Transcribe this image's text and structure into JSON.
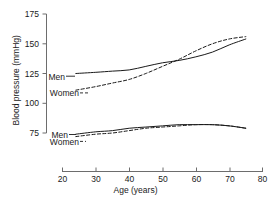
{
  "chart_data": {
    "type": "line",
    "title": "",
    "xlabel": "Age (years)",
    "ylabel": "Blood pressure (mmHg)",
    "xlim": [
      20,
      80
    ],
    "ylim": [
      75,
      175
    ],
    "xticks": [
      20,
      30,
      40,
      50,
      60,
      70,
      80
    ],
    "xtick_labels": [
      "20",
      "30",
      "40",
      "50",
      "60",
      "70",
      "80"
    ],
    "yticks": [
      75,
      100,
      125,
      150,
      175
    ],
    "ytick_labels": [
      "75",
      "100",
      "125",
      "150",
      "175"
    ],
    "grid": false,
    "legend_position": "inline-left",
    "x": [
      24,
      30,
      35,
      40,
      45,
      50,
      55,
      60,
      65,
      70,
      75
    ],
    "series": [
      {
        "name": "Men systolic",
        "label": "Men",
        "style": "solid",
        "group": "systolic",
        "values": [
          125,
          126,
          127,
          128,
          131,
          134,
          136,
          139,
          143,
          149,
          154
        ]
      },
      {
        "name": "Women systolic",
        "label": "Women",
        "style": "dashed",
        "group": "systolic",
        "values": [
          111,
          114,
          117,
          120,
          125,
          131,
          137,
          144,
          150,
          154,
          156
        ]
      },
      {
        "name": "Men diastolic",
        "label": "Men",
        "style": "solid",
        "group": "diastolic",
        "values": [
          74,
          76,
          77,
          79,
          80,
          81,
          82,
          82,
          82,
          81,
          79
        ]
      },
      {
        "name": "Women diastolic",
        "label": "Women",
        "style": "dashed",
        "group": "diastolic",
        "values": [
          72,
          74,
          75,
          77,
          79,
          80,
          81,
          82,
          82,
          81,
          79
        ]
      }
    ],
    "annotations": [
      {
        "text": "Men",
        "group": "systolic",
        "at_x": 24,
        "at_y": 125
      },
      {
        "text": "Women",
        "group": "systolic",
        "at_x": 24,
        "at_y": 111
      },
      {
        "text": "Men",
        "group": "diastolic",
        "at_x": 24,
        "at_y": 74
      },
      {
        "text": "Women",
        "group": "diastolic",
        "at_x": 24,
        "at_y": 72
      }
    ],
    "colors": {
      "line": "#1a1a1a",
      "axis": "#6d6d6d",
      "background": "#ffffff"
    }
  },
  "labels": {
    "y_title": "Blood pressure (mmHg)",
    "x_title": "Age (years)",
    "yticks": [
      "175",
      "150",
      "125",
      "100",
      "75"
    ],
    "xticks": [
      "20",
      "30",
      "40",
      "50",
      "60",
      "70",
      "80"
    ],
    "series_men_systolic": "Men",
    "series_women_systolic": "Women",
    "series_men_diastolic": "Men",
    "series_women_diastolic": "Women"
  }
}
